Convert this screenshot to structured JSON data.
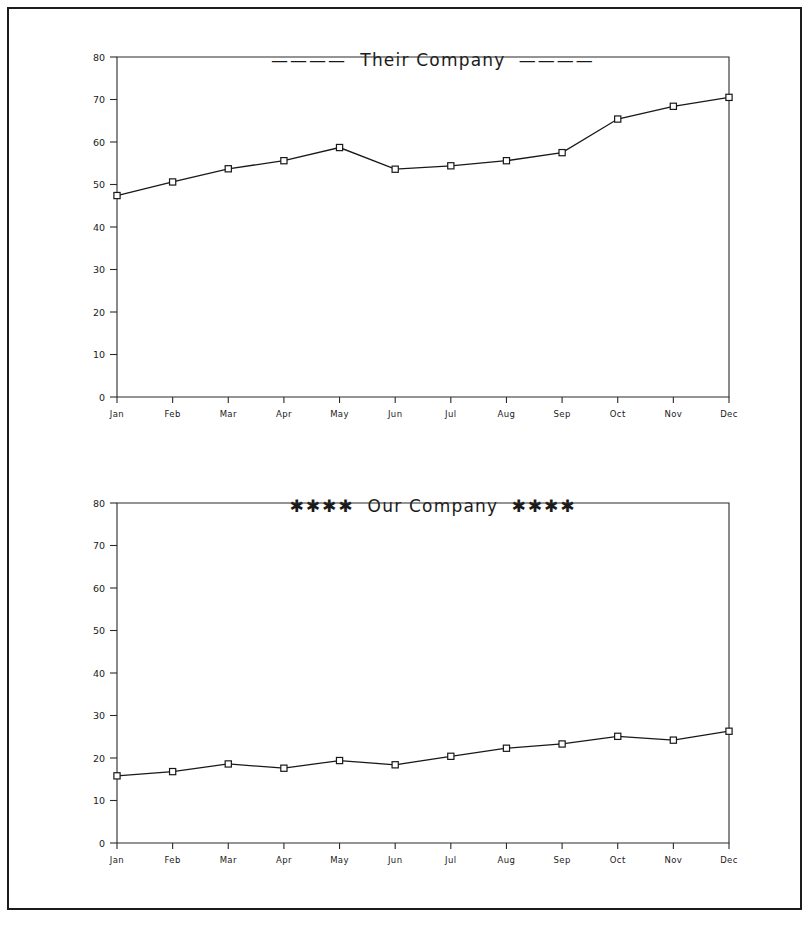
{
  "page": {
    "background_color": "#ffffff",
    "frame_color": "#1c1c1c"
  },
  "charts": [
    {
      "id": "their-company",
      "title_text": "Their Company",
      "title_decoration_left": "————",
      "title_decoration_right": "————",
      "decoration_kind": "dashes"
    },
    {
      "id": "our-company",
      "title_text": "Our Company",
      "title_decoration_left": "✱✱✱✱",
      "title_decoration_right": "✱✱✱✱",
      "decoration_kind": "asterisks"
    }
  ],
  "chart_data": [
    {
      "type": "line",
      "title": "Their Company",
      "xlabel": "",
      "ylabel": "",
      "categories": [
        "Jan",
        "Feb",
        "Mar",
        "Apr",
        "May",
        "Jun",
        "Jul",
        "Aug",
        "Sep",
        "Oct",
        "Nov",
        "Dec"
      ],
      "values": [
        47.4,
        50.6,
        53.7,
        55.6,
        58.7,
        53.6,
        54.4,
        55.6,
        57.5,
        65.4,
        68.4,
        70.5
      ],
      "series": [
        {
          "name": "Their Company",
          "values": [
            47.4,
            50.6,
            53.7,
            55.6,
            58.7,
            53.6,
            54.4,
            55.6,
            57.5,
            65.4,
            68.4,
            70.5
          ]
        }
      ],
      "ylim": [
        0,
        80
      ],
      "yticks": [
        0,
        10,
        20,
        30,
        40,
        50,
        60,
        70,
        80
      ],
      "ytick_labels": [
        "0",
        "10",
        "20",
        "30",
        "40",
        "50",
        "60",
        "70",
        "80"
      ],
      "grid": false,
      "legend": "none",
      "marker": "square-open",
      "line_color": "#181818"
    },
    {
      "type": "line",
      "title": "Our Company",
      "xlabel": "",
      "ylabel": "",
      "categories": [
        "Jan",
        "Feb",
        "Mar",
        "Apr",
        "May",
        "Jun",
        "Jul",
        "Aug",
        "Sep",
        "Oct",
        "Nov",
        "Dec"
      ],
      "values": [
        15.8,
        16.8,
        18.6,
        17.6,
        19.4,
        18.4,
        20.4,
        22.3,
        23.3,
        25.1,
        24.2,
        26.3
      ],
      "series": [
        {
          "name": "Our Company",
          "values": [
            15.8,
            16.8,
            18.6,
            17.6,
            19.4,
            18.4,
            20.4,
            22.3,
            23.3,
            25.1,
            24.2,
            26.3
          ]
        }
      ],
      "ylim": [
        0,
        80
      ],
      "yticks": [
        0,
        10,
        20,
        30,
        40,
        50,
        60,
        70,
        80
      ],
      "ytick_labels": [
        "0",
        "10",
        "20",
        "30",
        "40",
        "50",
        "60",
        "70",
        "80"
      ],
      "grid": false,
      "legend": "none",
      "marker": "square-open",
      "line_color": "#181818"
    }
  ]
}
